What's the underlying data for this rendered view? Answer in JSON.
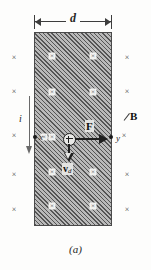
{
  "figure": {
    "caption": "(a)",
    "width_label": "d",
    "current_label": "i",
    "field_label": "B",
    "force_label": "F",
    "velocity_label": {
      "symbol": "v",
      "subscript": "d"
    },
    "terminal_left_label": "x",
    "terminal_right_label": "y",
    "carrier_sign": "+",
    "cross_glyph": "×",
    "colors": {
      "page_background": "#fdfdfc",
      "strip_fill": "#b9b9b9",
      "strip_hatch": "#555555",
      "strip_border": "#4a4a4a",
      "ink": "#1f1f1f",
      "cross": "#3d3d3d",
      "arrow_gray": "#6a6a6a",
      "cross_badge": "#f2f2f0"
    },
    "crosses_outside_left": [
      {
        "x": 14,
        "y": 58
      },
      {
        "x": 14,
        "y": 92
      },
      {
        "x": 14,
        "y": 136
      },
      {
        "x": 14,
        "y": 175
      },
      {
        "x": 14,
        "y": 210
      }
    ],
    "crosses_outside_right": [
      {
        "x": 127,
        "y": 58
      },
      {
        "x": 127,
        "y": 92
      },
      {
        "x": 124,
        "y": 136
      },
      {
        "x": 127,
        "y": 175
      },
      {
        "x": 127,
        "y": 210
      }
    ],
    "crosses_inside": [
      {
        "x": 52,
        "y": 56
      },
      {
        "x": 93,
        "y": 56
      },
      {
        "x": 52,
        "y": 92
      },
      {
        "x": 93,
        "y": 92
      },
      {
        "x": 44,
        "y": 137
      },
      {
        "x": 52,
        "y": 137
      },
      {
        "x": 52,
        "y": 172
      },
      {
        "x": 93,
        "y": 172
      },
      {
        "x": 52,
        "y": 206
      },
      {
        "x": 93,
        "y": 206
      }
    ],
    "terminals": [
      {
        "dot_x": 35,
        "dot_y": 137,
        "label": "x",
        "label_x": 41,
        "label_y": 137
      },
      {
        "dot_x": 111,
        "dot_y": 137,
        "label": "y",
        "label_x": 118,
        "label_y": 138
      }
    ]
  }
}
